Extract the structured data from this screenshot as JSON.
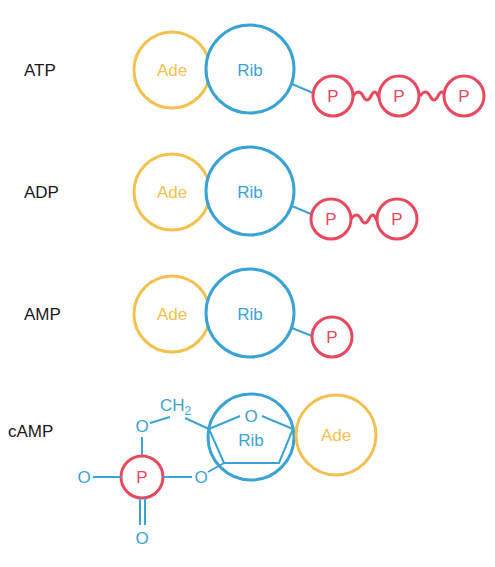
{
  "colors": {
    "adenine": "#f2c14e",
    "ribose": "#3aa3d6",
    "phosphate": "#e8495f",
    "label": "#1a1a1a"
  },
  "molecules": [
    {
      "label": "ATP",
      "adenine": "Ade",
      "ribose": "Rib",
      "phosphates": [
        "P",
        "P",
        "P"
      ]
    },
    {
      "label": "ADP",
      "adenine": "Ade",
      "ribose": "Rib",
      "phosphates": [
        "P",
        "P"
      ]
    },
    {
      "label": "AMP",
      "adenine": "Ade",
      "ribose": "Rib",
      "phosphates": [
        "P"
      ]
    },
    {
      "label": "cAMP",
      "adenine": "Ade",
      "ribose": "Rib",
      "phosphates": [
        "P"
      ],
      "atoms": {
        "ch2": "CH",
        "ch2_sub": "2",
        "ring_o": "O",
        "o_top": "O",
        "o_left": "O",
        "o_right": "O",
        "o_bottom": "O"
      }
    }
  ]
}
